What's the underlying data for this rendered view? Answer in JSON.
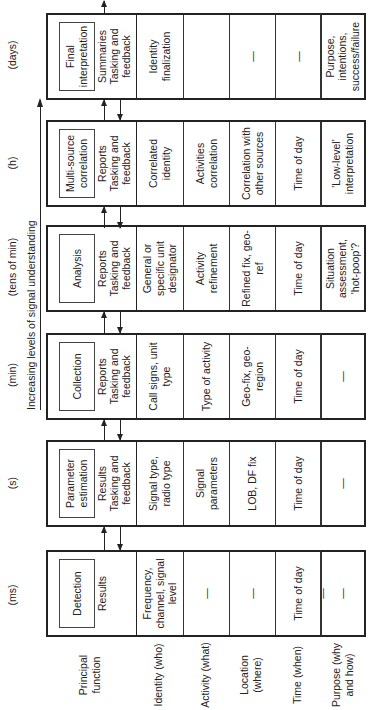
{
  "diagram": {
    "axis_label": "Increasing levels of signal understanding",
    "timescales": [
      "(ms)",
      "(s)",
      "(min)",
      "(tens of min)",
      "(h)",
      "(days)"
    ],
    "row_labels": [
      "Principal function",
      "Identity (who)",
      "Activity (what)",
      "Location (where)",
      "Time (when)",
      "Purpose (why and how)"
    ],
    "stages": [
      {
        "function": "Detection",
        "output": "Results",
        "feedback": "",
        "identity": "Frequency, channel, signal level",
        "activity": "—",
        "location": "—",
        "time": "Time of day",
        "purpose": "—"
      },
      {
        "function": "Parameter estimation",
        "output": "Results",
        "feedback": "Tasking and feedback",
        "identity": "Signal type, radio type",
        "activity": "Signal parameters",
        "location": "LOB, DF fix",
        "time": "Time of day",
        "purpose": "—"
      },
      {
        "function": "Collection",
        "output": "Reports",
        "feedback": "Tasking and feedback",
        "identity": "Call signs, unit type",
        "activity": "Type of activity",
        "location": "Geo-fix, geo-region",
        "time": "Time of day",
        "purpose": "—"
      },
      {
        "function": "Analysis",
        "output": "Reports",
        "feedback": "Tasking and feedback",
        "identity": "General or specific unit designator",
        "activity": "Activity refinement",
        "location": "Refined fix, geo-ref",
        "time": "Time of day",
        "purpose": "Situation assessment, 'hot-poop'?"
      },
      {
        "function": "Multi-source correlation",
        "output": "Reports",
        "feedback": "Tasking and feedback",
        "identity": "Correlated identity",
        "activity": "Activities correlation",
        "location": "Correlation with other sources",
        "time": "Time of day",
        "purpose": "'Low-level' interpretation"
      },
      {
        "function": "Final interpretation",
        "output": "Summaries",
        "feedback": "Tasking and feedback",
        "identity": "Identity finalization",
        "activity": "",
        "location": "—",
        "time": "—",
        "purpose": "Purpose, intentions, success/failure"
      }
    ]
  },
  "colors": {
    "line": "#222222",
    "background": "#ffffff"
  }
}
